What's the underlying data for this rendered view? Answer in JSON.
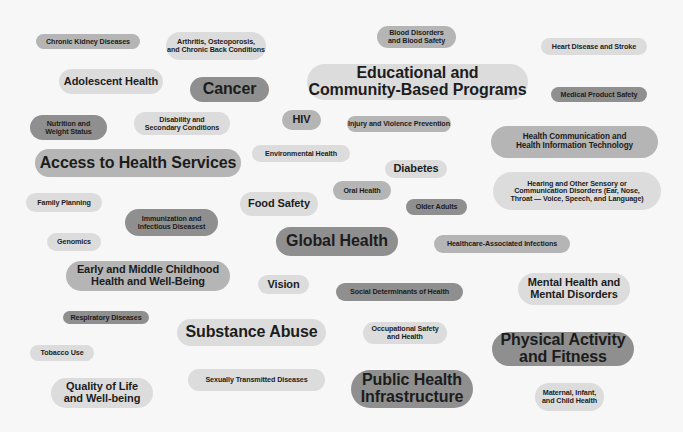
{
  "colors": {
    "background": "#f7f7f7",
    "light_pill": "#dcdcdc",
    "mid_pill": "#b5b5b5",
    "dark_pill": "#8f8f8f",
    "text": "#1c1c1c"
  },
  "tags": [
    {
      "label": "Chronic Kidney Diseases"
    },
    {
      "label": "Arthritis, Osteoporosis,\nand Chronic Back Conditions"
    },
    {
      "label": "Blood Disorders\nand Blood Safety"
    },
    {
      "label": "Heart Disease and Stroke"
    },
    {
      "label": "Adolescent Health"
    },
    {
      "label": "Cancer"
    },
    {
      "label": "Educational and\nCommunity-Based Programs"
    },
    {
      "label": "Medical Product Safety"
    },
    {
      "label": "Nutrition and\nWeight Status"
    },
    {
      "label": "Disability and\nSecondary Conditions"
    },
    {
      "label": "HIV"
    },
    {
      "label": "Injury and Violence Prevention"
    },
    {
      "label": "Health Communication and\nHealth Information Technology"
    },
    {
      "label": "Access to Health Services"
    },
    {
      "label": "Environmental Health"
    },
    {
      "label": "Diabetes"
    },
    {
      "label": "Oral Health"
    },
    {
      "label": "Hearing and Other Sensory or\nCommunication Disorders (Ear, Nose,\nThroat — Voice, Speech, and Language)"
    },
    {
      "label": "Family Planning"
    },
    {
      "label": "Food Safety"
    },
    {
      "label": "Older Adults"
    },
    {
      "label": "Immunization and\nInfectious Diseasest"
    },
    {
      "label": "Genomics"
    },
    {
      "label": "Global Health"
    },
    {
      "label": "Healthcare-Associated Infections"
    },
    {
      "label": "Early and Middle Childhood\nHealth and Well-Being"
    },
    {
      "label": "Vision"
    },
    {
      "label": "Social Determinants of Health"
    },
    {
      "label": "Mental Health and\nMental Disorders"
    },
    {
      "label": "Respiratory Diseases"
    },
    {
      "label": "Substance Abuse"
    },
    {
      "label": "Occupational Safety\nand Health"
    },
    {
      "label": "Physical Activity\nand Fitness"
    },
    {
      "label": "Tobacco Use"
    },
    {
      "label": "Sexually Transmitted Diseases"
    },
    {
      "label": "Public Health\nInfrastructure"
    },
    {
      "label": "Quality of Life\nand Well-being"
    },
    {
      "label": "Maternal, Infant,\nand Child Health"
    }
  ]
}
